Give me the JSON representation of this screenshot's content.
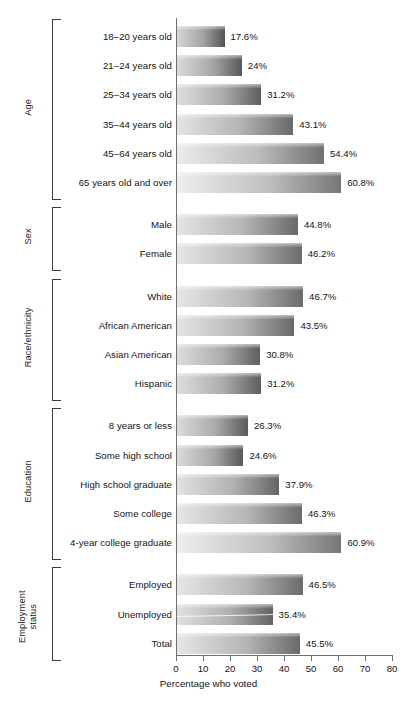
{
  "chart_data": {
    "type": "bar",
    "orientation": "horizontal",
    "title": "",
    "xlabel": "Percentage who voted",
    "ylabel": "",
    "xlim": [
      0,
      80
    ],
    "xticks": [
      0,
      10,
      20,
      30,
      40,
      50,
      60,
      70,
      80
    ],
    "grid": false,
    "legend": null,
    "value_suffix": "%",
    "groups": [
      {
        "name": "Age",
        "categories": [
          "18–20 years old",
          "21–24 years old",
          "25–34 years old",
          "35–44 years old",
          "45–64 years old",
          "65 years old and over"
        ],
        "values": [
          17.6,
          24,
          31.2,
          43.1,
          54.4,
          60.8
        ],
        "value_labels": [
          "17.6%",
          "24%",
          "31.2%",
          "43.1%",
          "54.4%",
          "60.8%"
        ]
      },
      {
        "name": "Sex",
        "categories": [
          "Male",
          "Female"
        ],
        "values": [
          44.8,
          46.2
        ],
        "value_labels": [
          "44.8%",
          "46.2%"
        ]
      },
      {
        "name": "Race/ethnicity",
        "categories": [
          "White",
          "African American",
          "Asian American",
          "Hispanic"
        ],
        "values": [
          46.7,
          43.5,
          30.8,
          31.2
        ],
        "value_labels": [
          "46.7%",
          "43.5%",
          "30.8%",
          "31.2%"
        ]
      },
      {
        "name": "Education",
        "categories": [
          "8 years or less",
          "Some high school",
          "High school graduate",
          "Some college",
          "4-year college graduate"
        ],
        "values": [
          26.3,
          24.6,
          37.9,
          46.3,
          60.9
        ],
        "value_labels": [
          "26.3%",
          "24.6%",
          "37.9%",
          "46.3%",
          "60.9%"
        ]
      },
      {
        "name": "Employment status",
        "name_lines": [
          "Employment",
          "status"
        ],
        "categories": [
          "Employed",
          "Unemployed",
          "Total"
        ],
        "values": [
          46.5,
          35.4,
          45.5
        ],
        "value_labels": [
          "46.5%",
          "35.4%",
          "45.5%"
        ]
      }
    ]
  },
  "colors": {
    "bar_light": "#efefef",
    "bar_dark": "#6d6d6d",
    "axis": "#6e6e6e",
    "bracket": "#3b3b3b",
    "text": "#141414",
    "background": "#ffffff"
  },
  "axis": {
    "title": "Percentage who voted",
    "tick_labels": [
      "0",
      "10",
      "20",
      "30",
      "40",
      "50",
      "60",
      "70",
      "80"
    ]
  }
}
